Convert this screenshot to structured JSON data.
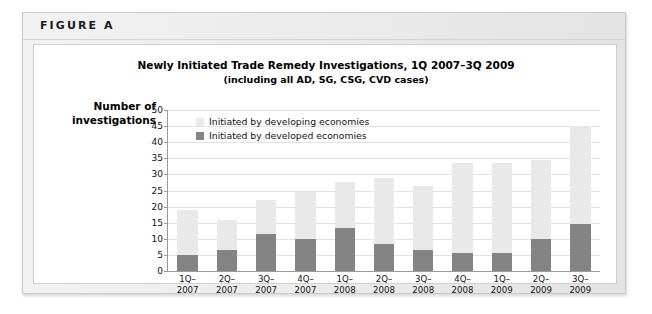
{
  "figure": {
    "label": "FIGURE A"
  },
  "chart_data": {
    "type": "bar",
    "subtype": "stacked-column",
    "title": "Newly Initiated Trade Remedy Investigations, 1Q 2007–3Q 2009",
    "subtitle": "(including all AD, SG, CSG, CVD cases)",
    "xlabel": "",
    "ylabel": "Number of investigations",
    "ylabel_line1": "Number of",
    "ylabel_line2": "investigations",
    "ylim": [
      0,
      50
    ],
    "ytick_step": 5,
    "yticks": [
      0,
      5,
      10,
      15,
      20,
      25,
      30,
      35,
      40,
      45,
      50
    ],
    "grid": true,
    "legend_position": "inside-top-left",
    "categories": [
      "1Q–2007",
      "2Q–2007",
      "3Q–2007",
      "4Q–2007",
      "1Q–2008",
      "2Q–2008",
      "3Q–2008",
      "4Q–2008",
      "1Q–2009",
      "2Q–2009",
      "3Q–2009"
    ],
    "category_lines": [
      [
        "1Q–",
        "2007"
      ],
      [
        "2Q–",
        "2007"
      ],
      [
        "3Q–",
        "2007"
      ],
      [
        "4Q–",
        "2007"
      ],
      [
        "1Q–",
        "2008"
      ],
      [
        "2Q–",
        "2008"
      ],
      [
        "3Q–",
        "2008"
      ],
      [
        "4Q–",
        "2008"
      ],
      [
        "1Q–",
        "2009"
      ],
      [
        "2Q–",
        "2009"
      ],
      [
        "3Q–",
        "2009"
      ]
    ],
    "series": [
      {
        "name": "Initiated by developed economies",
        "color": "#848484",
        "values": [
          5,
          6.5,
          11.5,
          10,
          13.5,
          8.5,
          6.5,
          5.5,
          5.5,
          10,
          14.5
        ]
      },
      {
        "name": "Initiated by developing economies",
        "color": "#e9e9e9",
        "values": [
          14,
          9.5,
          10.5,
          14.5,
          14,
          20.5,
          20,
          28,
          28,
          24.5,
          30.5
        ]
      }
    ],
    "totals": [
      19,
      16,
      22,
      24.5,
      27.5,
      29,
      26.5,
      33.5,
      33.5,
      34.5,
      45
    ],
    "legend": [
      {
        "label": "Initiated by developing economies",
        "color": "#e9e9e9"
      },
      {
        "label": "Initiated by developed economies",
        "color": "#848484"
      }
    ]
  }
}
